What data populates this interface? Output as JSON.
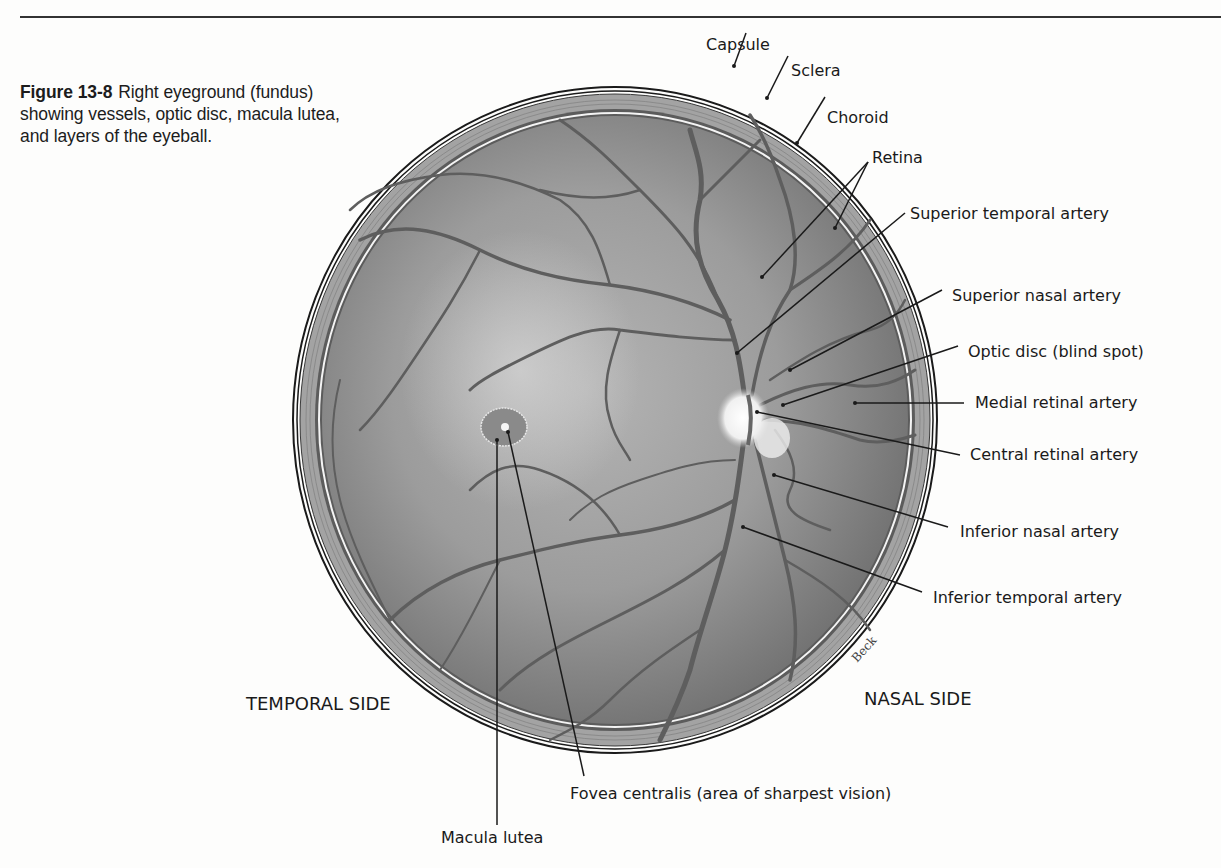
{
  "caption": {
    "figure_number": "Figure 13-8",
    "text": "Right eyeground (fundus) showing vessels, optic disc, macula lutea, and layers of the eyeball."
  },
  "labels": {
    "capsule": "Capsule",
    "sclera": "Sclera",
    "choroid": "Choroid",
    "retina": "Retina",
    "superior_temporal_artery": "Superior temporal artery",
    "superior_nasal_artery": "Superior nasal artery",
    "optic_disc": "Optic disc (blind spot)",
    "medial_retinal_artery": "Medial retinal artery",
    "central_retinal_artery": "Central retinal artery",
    "inferior_nasal_artery": "Inferior nasal artery",
    "inferior_temporal_artery": "Inferior temporal artery",
    "fovea_centralis": "Fovea centralis (area of sharpest vision)",
    "macula_lutea": "Macula lutea"
  },
  "sides": {
    "temporal": "TEMPORAL SIDE",
    "nasal": "NASAL SIDE"
  },
  "signature": "Beck",
  "colors": {
    "fundus": "#8e8e8e",
    "sclera": "#9a9a9a",
    "vessel": "#5a5a5a",
    "line": "#1a1a1a"
  }
}
